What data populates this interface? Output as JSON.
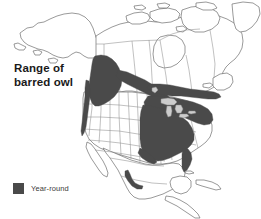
{
  "figure": {
    "kind": "range-map",
    "subject": "barred owl",
    "region": "North America",
    "background_color": "#ffffff"
  },
  "title": {
    "line1": "Range of",
    "line2": "barred owl",
    "full": "Range of barred owl"
  },
  "legend": {
    "items": [
      {
        "label": "Year-round",
        "color": "#4a4a4a",
        "swatch_icon": "filled-square-icon"
      }
    ]
  },
  "map": {
    "outline_color": "#6f6f6f",
    "subdivision_color": "#8d8d8d",
    "land_fill": "#ffffff",
    "lake_fill": "#cccccc",
    "range_fill": "#4a4a4a",
    "landmasses": [
      "Alaska",
      "Canada mainland",
      "Arctic archipelago",
      "Newfoundland",
      "Contiguous United States",
      "Mexico",
      "Central America",
      "Baja California",
      "Cuba"
    ],
    "range_regions": [
      "Pacific Northwest and British Columbia",
      "Northern Rockies and boreal corridor",
      "Central and eastern Canada",
      "Great Lakes and Northeast United States",
      "Southeastern United States",
      "Sierra Madre Occidental (Mexico)"
    ],
    "unshaded_features": [
      "Hudson Bay",
      "Great Lakes",
      "Newfoundland",
      "Great Plains interior",
      "Southwestern deserts"
    ]
  }
}
